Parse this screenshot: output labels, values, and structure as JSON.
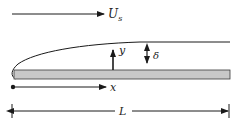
{
  "diagram": {
    "freestream": {
      "label": "U",
      "subscript": "s"
    },
    "axes": {
      "x_label": "x",
      "y_label": "y"
    },
    "thickness_label": "δ",
    "length_label": "L",
    "colors": {
      "line": "#1a1a1a",
      "plate_fill": "#c8c8c8",
      "plate_edge": "#3a3a3a",
      "text": "#222222"
    }
  }
}
